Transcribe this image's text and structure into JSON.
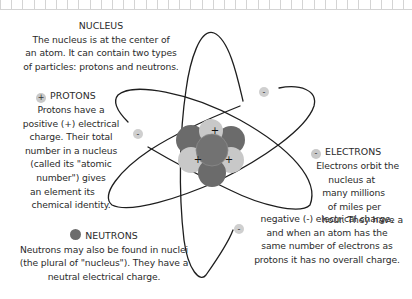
{
  "nucleus": {
    "title": "NUCLEUS",
    "lines": [
      "The nucleus is at the center of",
      "an atom. It can contain two types",
      "of particles: protons and neutrons."
    ]
  },
  "protons": {
    "icon": "+",
    "title": "PROTONS",
    "lines": [
      "Protons have a",
      "positive (+) electrical",
      "charge. Their total",
      "number in a nucleus",
      "(called its \"atomic",
      "number\") gives",
      "an element its",
      "chemical identity."
    ]
  },
  "electrons": {
    "icon": "-",
    "title": "ELECTRONS",
    "lines": [
      "Electrons orbit the",
      "nucleus at",
      "many millions",
      "of miles per",
      "hour. They have a",
      "negative (-) electrical charge,",
      "and when an atom has the",
      "same number of electrons as",
      "protons it has no overall charge."
    ]
  },
  "neutrons": {
    "title": "NEUTRONS",
    "lines": [
      "Neutrons may also be found in nuclei",
      "(the plural of \"nucleus\"). They have a",
      "neutral electrical charge."
    ]
  },
  "diagram": {
    "proton_sign": "+",
    "electron_sign": "-",
    "colors": {
      "proton": "#c8c8c8",
      "neutron": "#6b6b6b",
      "electron": "#cfcfcf",
      "orbit": "#1e1e1e"
    }
  }
}
